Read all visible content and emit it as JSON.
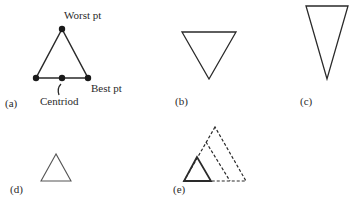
{
  "figure": {
    "panels": [
      {
        "id": "a",
        "label": "(a)"
      },
      {
        "id": "b",
        "label": "(b)"
      },
      {
        "id": "c",
        "label": "(c)"
      },
      {
        "id": "d",
        "label": "(d)"
      },
      {
        "id": "e",
        "label": "(e)"
      }
    ],
    "annotations": {
      "worst": "Worst pt",
      "best": "Best pt",
      "centroid": "Centriod"
    },
    "colors": {
      "stroke": "#2a2a2a",
      "background": "#ffffff"
    }
  }
}
